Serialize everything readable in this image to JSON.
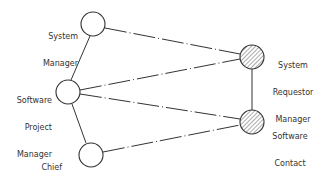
{
  "diagram": {
    "nodes": [
      {
        "id": "system-manager",
        "label_lines": [
          "System",
          "Manager"
        ],
        "style": "hollow"
      },
      {
        "id": "software-project-manager",
        "label_lines": [
          "Software",
          "Project",
          "Manager"
        ],
        "style": "hollow"
      },
      {
        "id": "chief-programmer",
        "label_lines": [
          "Chief",
          "Programmer"
        ],
        "style": "hollow"
      },
      {
        "id": "system-requestor-manager",
        "label_lines": [
          "System",
          "Requestor",
          "Manager"
        ],
        "style": "hatched"
      },
      {
        "id": "software-contact",
        "label_lines": [
          "Software",
          "Contact"
        ],
        "style": "hatched"
      }
    ],
    "edges": [
      {
        "from": "system-manager",
        "to": "software-project-manager",
        "style": "solid"
      },
      {
        "from": "software-project-manager",
        "to": "chief-programmer",
        "style": "solid"
      },
      {
        "from": "system-requestor-manager",
        "to": "software-contact",
        "style": "solid"
      },
      {
        "from": "system-manager",
        "to": "system-requestor-manager",
        "style": "dash-dot"
      },
      {
        "from": "software-project-manager",
        "to": "system-requestor-manager",
        "style": "dash-dot"
      },
      {
        "from": "software-project-manager",
        "to": "software-contact",
        "style": "dash-dot"
      },
      {
        "from": "chief-programmer",
        "to": "software-contact",
        "style": "dash-dot"
      }
    ],
    "colors": {
      "stroke": "#333333",
      "hatch": "#555555",
      "fill": "#ffffff"
    }
  }
}
